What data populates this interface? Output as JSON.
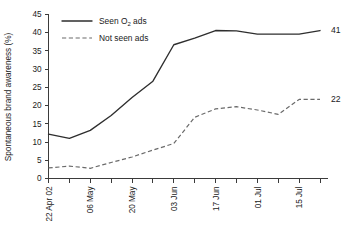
{
  "chart_data": {
    "type": "line",
    "title": "",
    "xlabel": "",
    "ylabel": "Spontaneous brand awareness (%)",
    "ylim": [
      0,
      45
    ],
    "yticks": [
      0,
      5,
      10,
      15,
      20,
      25,
      30,
      35,
      40,
      45
    ],
    "grid": false,
    "legend_position": "top-left",
    "x": [
      "22 Apr 02",
      "29 Apr",
      "06 May",
      "13 May",
      "20 May",
      "27 May",
      "03 Jun",
      "10 Jun",
      "17 Jun",
      "24 Jun",
      "01 Jul",
      "08 Jul",
      "15 Jul",
      "22 Jul"
    ],
    "xtick_labels": [
      "22 Apr 02",
      "06 May",
      "20 May",
      "03 Jun",
      "17 Jun",
      "01 Jul",
      "15 Jul"
    ],
    "xtick_label_indices": [
      0,
      2,
      4,
      6,
      8,
      10,
      12
    ],
    "series": [
      {
        "name": "Seen O2 ads",
        "style": "solid",
        "color": "#2e2e2e",
        "values": [
          12.2,
          11.0,
          13.2,
          17.3,
          22.2,
          26.7,
          36.7,
          38.5,
          40.6,
          40.5,
          39.6,
          39.6,
          39.6,
          40.6
        ],
        "end_label": "41"
      },
      {
        "name": "Not seen ads",
        "style": "dashed",
        "color": "#6a6a6a",
        "values": [
          2.9,
          3.4,
          2.8,
          4.4,
          5.9,
          7.8,
          9.6,
          16.8,
          19.1,
          19.7,
          18.8,
          17.6,
          21.7,
          21.7
        ],
        "end_label": "22"
      }
    ]
  },
  "legend": {
    "items": [
      {
        "label_pre": "Seen O",
        "label_sub": "2",
        "label_post": " ads",
        "style": "solid"
      },
      {
        "label_pre": "Not seen ads",
        "label_sub": "",
        "label_post": "",
        "style": "dashed"
      }
    ]
  },
  "axes": {
    "y_title": "Spontaneous brand awareness (%)",
    "y_labels": [
      "45",
      "40",
      "35",
      "30",
      "25",
      "20",
      "15",
      "10",
      "5",
      "0"
    ],
    "x_labels": [
      "22 Apr 02",
      "06 May",
      "20 May",
      "03 Jun",
      "17 Jun",
      "01 Jul",
      "15 Jul"
    ]
  },
  "annotations": {
    "solid_end": "41",
    "dashed_end": "22"
  }
}
